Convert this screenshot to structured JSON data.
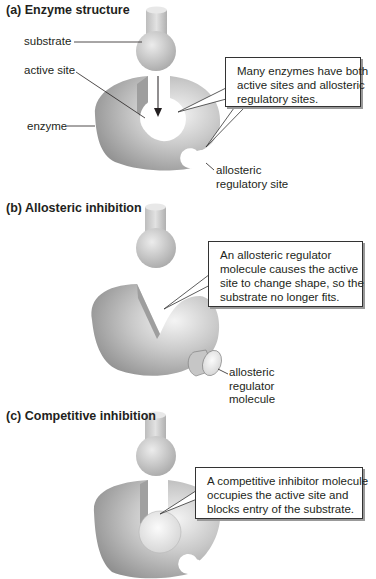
{
  "panels": [
    {
      "id": "a",
      "title": "(a)  Enzyme structure",
      "labels": {
        "substrate": "substrate",
        "active_site": "active site",
        "enzyme": "enzyme",
        "allosteric_site": [
          "allosteric",
          "regulatory site"
        ]
      },
      "callout": [
        "Many enzymes have both",
        "active sites and allosteric",
        "regulatory sites."
      ]
    },
    {
      "id": "b",
      "title": "(b)  Allosteric inhibition",
      "labels": {
        "allosteric_regulator": [
          "allosteric",
          "regulator",
          "molecule"
        ]
      },
      "callout": [
        "An allosteric regulator",
        "molecule causes the active",
        "site to change shape, so the",
        "substrate no longer fits."
      ]
    },
    {
      "id": "c",
      "title": "(c)  Competitive inhibition",
      "labels": {},
      "callout": [
        "A competitive inhibitor molecule",
        "occupies the active site and",
        "blocks entry of the substrate."
      ]
    }
  ],
  "colors": {
    "enzyme_dark": "#8a8a8a",
    "enzyme_light": "#e6e6e6",
    "substrate": "#c8c8c8",
    "line": "#231f20"
  }
}
